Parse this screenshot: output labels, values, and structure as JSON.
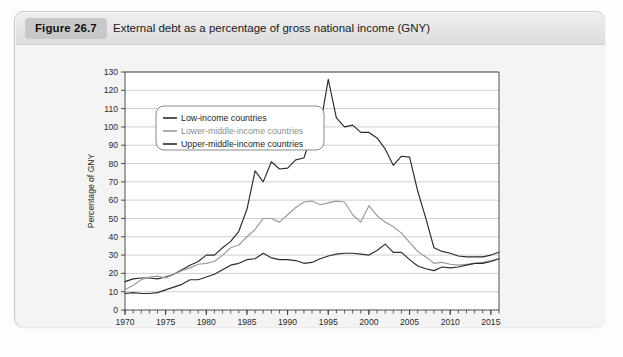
{
  "figure": {
    "badge": "Figure 26.7",
    "title": "External debt as a percentage of gross national income (GNY)"
  },
  "colors": {
    "plot_background": "#ffffff",
    "card_background": "#f2f2f2",
    "header_background": "#e6e6e6",
    "badge_background": "#c8c8c8",
    "gridline": "#b9b9b9",
    "axis": "#3a3a3a",
    "series_low_income": "#2b2b2b",
    "series_lower_middle": "#9a9a9a",
    "series_upper_middle": "#2b2b2b"
  },
  "chart_data": {
    "type": "line",
    "title": "External debt as a percentage of gross national income (GNY)",
    "xlabel": "",
    "ylabel": "Percentage of GNY",
    "xlim": [
      1970,
      2016
    ],
    "ylim": [
      0,
      130
    ],
    "ytick_step": 10,
    "yticks": [
      0,
      10,
      20,
      30,
      40,
      50,
      60,
      70,
      80,
      90,
      100,
      110,
      120,
      130
    ],
    "xticks_major": [
      1970,
      1975,
      1980,
      1985,
      1990,
      1995,
      2000,
      2005,
      2010,
      2015
    ],
    "xticks_minor_every": 1,
    "grid": "horizontal",
    "legend_position": "top-left",
    "x": [
      1970,
      1971,
      1972,
      1973,
      1974,
      1975,
      1976,
      1977,
      1978,
      1979,
      1980,
      1981,
      1982,
      1983,
      1984,
      1985,
      1986,
      1987,
      1988,
      1989,
      1990,
      1991,
      1992,
      1993,
      1994,
      1995,
      1996,
      1997,
      1998,
      1999,
      2000,
      2001,
      2002,
      2003,
      2004,
      2005,
      2006,
      2007,
      2008,
      2009,
      2010,
      2011,
      2012,
      2013,
      2014,
      2015,
      2016
    ],
    "series": [
      {
        "name": "Low-income countries",
        "color": "#2b2b2b",
        "values": [
          15.5,
          17.0,
          17.5,
          17.5,
          17.0,
          18.0,
          19.5,
          22.0,
          24.5,
          26.5,
          30.0,
          30.0,
          34.0,
          37.5,
          43.0,
          55.0,
          76.0,
          70.0,
          81.0,
          77.0,
          77.5,
          82.0,
          83.0,
          96.0,
          100.0,
          126.0,
          105.0,
          100.0,
          101.0,
          97.0,
          97.0,
          94.0,
          88.0,
          79.0,
          84.0,
          83.5,
          65.0,
          50.0,
          34.0,
          32.0,
          31.0,
          29.5,
          29.0,
          29.0,
          29.0,
          30.0,
          31.5
        ]
      },
      {
        "name": "Lower-middle-income countries",
        "color": "#9a9a9a",
        "values": [
          11.0,
          13.5,
          16.5,
          18.0,
          18.5,
          17.5,
          19.5,
          21.5,
          23.0,
          25.0,
          25.5,
          26.5,
          30.0,
          34.0,
          35.5,
          40.0,
          44.0,
          50.0,
          50.0,
          48.0,
          52.0,
          56.0,
          59.0,
          59.5,
          57.5,
          58.5,
          59.5,
          59.0,
          52.0,
          48.0,
          57.0,
          51.5,
          48.0,
          45.5,
          42.0,
          37.0,
          32.0,
          29.0,
          25.5,
          26.0,
          25.0,
          24.5,
          25.0,
          25.5,
          26.0,
          27.0,
          28.0
        ]
      },
      {
        "name": "Upper-middle-income countries",
        "color": "#2b2b2b",
        "values": [
          9.0,
          9.5,
          9.0,
          9.0,
          9.5,
          11.0,
          12.5,
          14.0,
          16.5,
          16.5,
          18.0,
          19.5,
          22.0,
          24.5,
          25.5,
          27.5,
          28.0,
          31.0,
          28.5,
          27.5,
          27.5,
          27.0,
          25.5,
          26.0,
          28.0,
          29.5,
          30.5,
          31.0,
          31.0,
          30.5,
          30.0,
          32.5,
          36.0,
          31.5,
          31.5,
          27.5,
          24.0,
          22.5,
          21.5,
          23.5,
          23.0,
          23.5,
          24.5,
          25.5,
          25.5,
          26.5,
          28.0
        ]
      }
    ]
  },
  "legend": {
    "items": [
      {
        "label": "Low-income countries",
        "tone": "dark"
      },
      {
        "label": "Lower-middle-income countries",
        "tone": "muted"
      },
      {
        "label": "Upper-middle-income countries",
        "tone": "dark"
      }
    ]
  }
}
